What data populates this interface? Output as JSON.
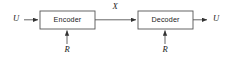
{
  "diagram": {
    "type": "block-diagram",
    "canvas": {
      "width": 229,
      "height": 63,
      "background": "#ffffff"
    },
    "stroke_color": "#555555",
    "text_color": "#1a1a1a",
    "blocks": [
      {
        "id": "encoder",
        "label": "Encoder",
        "x": 40,
        "y": 11,
        "width": 55,
        "height": 18
      },
      {
        "id": "decoder",
        "label": "Decoder",
        "x": 138,
        "y": 11,
        "width": 55,
        "height": 18
      }
    ],
    "signals": [
      {
        "id": "input-u",
        "label": "U",
        "x": 16,
        "y": 19
      },
      {
        "id": "channel-x",
        "label": "X",
        "x": 115,
        "y": 7
      },
      {
        "id": "output-u",
        "label": "U",
        "x": 216,
        "y": 19
      },
      {
        "id": "encoder-randomness-r",
        "label": "R",
        "x": 67,
        "y": 50
      },
      {
        "id": "decoder-randomness-r",
        "label": "R",
        "x": 165,
        "y": 50
      }
    ],
    "arrows": [
      {
        "id": "arrow-input-to-encoder",
        "from": "U",
        "to": "Encoder",
        "direction": "right"
      },
      {
        "id": "arrow-encoder-to-decoder",
        "from": "Encoder",
        "to": "Decoder",
        "direction": "right",
        "label": "X"
      },
      {
        "id": "arrow-decoder-to-output",
        "from": "Decoder",
        "to": "U",
        "direction": "right"
      },
      {
        "id": "arrow-r-to-encoder",
        "from": "R",
        "to": "Encoder",
        "direction": "up"
      },
      {
        "id": "arrow-r-to-decoder",
        "from": "R",
        "to": "Decoder",
        "direction": "up"
      }
    ]
  }
}
